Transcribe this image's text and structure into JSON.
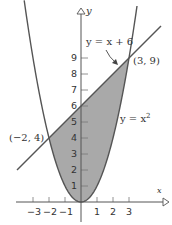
{
  "chart_data": {
    "type": "area",
    "title": "",
    "xlabel": "x",
    "ylabel": "y",
    "xlim": [
      -4,
      5.5
    ],
    "ylim": [
      0,
      12
    ],
    "grid": false,
    "x_ticks": [
      -3,
      -2,
      -1,
      1,
      2,
      3
    ],
    "x_tick_labels": [
      "−3",
      "−2",
      "−1",
      "1",
      "2",
      "3"
    ],
    "y_ticks": [
      1,
      2,
      3,
      4,
      5,
      6,
      7,
      8,
      9
    ],
    "y_tick_labels": [
      "1",
      "2",
      "3",
      "4",
      "5",
      "6",
      "7",
      "8",
      "9"
    ],
    "series": [
      {
        "name": "y = x + 6",
        "kind": "line",
        "x": [
          -4,
          5
        ],
        "y": [
          2,
          11
        ]
      },
      {
        "name": "y = x^2",
        "kind": "curve",
        "x": [
          -3.5,
          -3,
          -2,
          -1,
          0,
          1,
          2,
          3,
          3.5
        ],
        "y": [
          12.25,
          9,
          4,
          1,
          0,
          1,
          4,
          9,
          12.25
        ]
      }
    ],
    "shaded_region": {
      "between": [
        "y = x + 6",
        "y = x^2"
      ],
      "x_range": [
        -2,
        3
      ],
      "color": "#a9a9a9"
    },
    "annotations": [
      {
        "text": "(−2, 4)",
        "x": -2,
        "y": 4
      },
      {
        "text": "(3, 9)",
        "x": 3,
        "y": 9
      },
      {
        "text": "y = x + 6",
        "points_to": "line"
      },
      {
        "text": "y = x²",
        "points_to": "parabola"
      }
    ]
  },
  "labels": {
    "x_axis": "x",
    "y_axis": "y",
    "line_eq": "y = x + 6",
    "parabola_eq_base": "y = x",
    "parabola_eq_exp": "2",
    "point_left": "(−2, 4)",
    "point_right": "(3, 9)"
  },
  "colors": {
    "shade": "#a9a9a9",
    "curve": "#555555",
    "axis": "#555555",
    "text": "#333333"
  }
}
